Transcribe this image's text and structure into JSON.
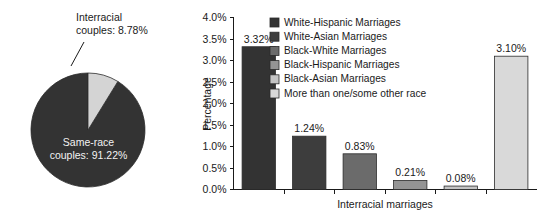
{
  "chart_data": [
    {
      "type": "pie",
      "title": "",
      "name": "marriage-composition-pie",
      "slices": [
        {
          "label": "Same-race couples",
          "value": 91.22,
          "display": "Same-race\ncouples: 91.22%",
          "color": "#333333"
        },
        {
          "label": "Interracial couples",
          "value": 8.78,
          "display": "Interracial\ncouples: 8.78%",
          "color": "#d4d4d4"
        }
      ],
      "labels": {
        "interracial_line1": "Interracial",
        "interracial_line2": "couples: 8.78%",
        "samerace_line1": "Same-race",
        "samerace_line2": "couples: 91.22%"
      },
      "start_angle_deg": 0,
      "direction": "clockwise"
    },
    {
      "type": "bar",
      "name": "interracial-marriage-types-bar",
      "title": "",
      "xlabel": "Interracial marriages",
      "ylabel": "Percentage",
      "ylim": [
        0,
        4.0
      ],
      "ytick_values": [
        0.0,
        0.5,
        1.0,
        1.5,
        2.0,
        2.5,
        3.0,
        3.5,
        4.0
      ],
      "ytick_labels": [
        "0.0%",
        "0.5%",
        "1.0%",
        "1.5%",
        "2.0%",
        "2.5%",
        "3.0%",
        "3.5%",
        "4.0%"
      ],
      "grid": false,
      "legend_position": "upper-center",
      "categories": [
        "White-Hispanic Marriages",
        "White-Asian Marriages",
        "Black-White Marriages",
        "Black-Hispanic Marriages",
        "Black-Asian Marriages",
        "More than one/some other race"
      ],
      "values": [
        3.32,
        1.24,
        0.83,
        0.21,
        0.08,
        3.1
      ],
      "value_labels": [
        "3.32%",
        "1.24%",
        "0.83%",
        "0.21%",
        "0.08%",
        "3.10%"
      ],
      "colors": [
        "#333333",
        "#3d3d3d",
        "#6b6b6b",
        "#949494",
        "#c4c4c4",
        "#d9d9d9"
      ],
      "legend": [
        {
          "label": "White-Hispanic Marriages",
          "color": "#333333"
        },
        {
          "label": "White-Asian Marriages",
          "color": "#3d3d3d"
        },
        {
          "label": "Black-White Marriages",
          "color": "#6b6b6b"
        },
        {
          "label": "Black-Hispanic Marriages",
          "color": "#949494"
        },
        {
          "label": "Black-Asian Marriages",
          "color": "#c4c4c4"
        },
        {
          "label": "More than one/some other race",
          "color": "#d9d9d9"
        }
      ]
    }
  ]
}
